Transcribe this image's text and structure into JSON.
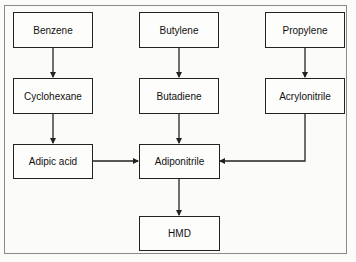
{
  "diagram": {
    "nodes": {
      "benzene": "Benzene",
      "butylene": "Butylene",
      "propylene": "Propylene",
      "cyclohexane": "Cyclohexane",
      "butadiene": "Butadiene",
      "acrylonitrile": "Acrylonitrile",
      "adipic_acid": "Adipic acid",
      "adiponitrile": "Adiponitrile",
      "hmd": "HMD"
    },
    "edges": [
      {
        "from": "Benzene",
        "to": "Cyclohexane"
      },
      {
        "from": "Cyclohexane",
        "to": "Adipic acid"
      },
      {
        "from": "Adipic acid",
        "to": "Adiponitrile"
      },
      {
        "from": "Butylene",
        "to": "Butadiene"
      },
      {
        "from": "Butadiene",
        "to": "Adiponitrile"
      },
      {
        "from": "Propylene",
        "to": "Acrylonitrile"
      },
      {
        "from": "Acrylonitrile",
        "to": "Adiponitrile"
      },
      {
        "from": "Adiponitrile",
        "to": "HMD"
      }
    ],
    "colors": {
      "line": "#222222",
      "frame": "#8a8a8a",
      "background": "#fbfbfa"
    }
  }
}
